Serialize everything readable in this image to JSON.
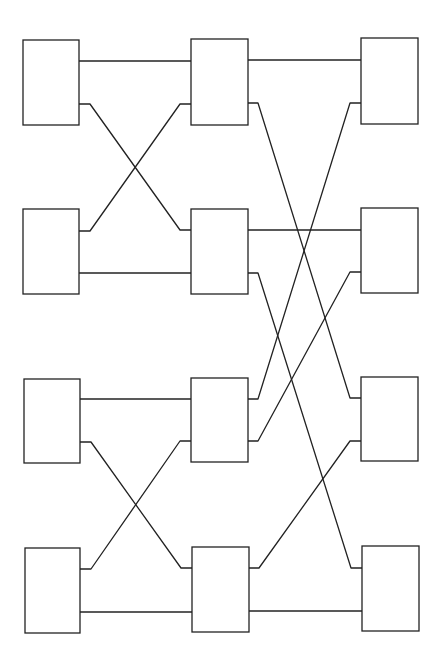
{
  "diagram": {
    "type": "butterfly-network",
    "stroke_color": "#222222",
    "background": "#ffffff",
    "columns": 3,
    "rows": 4,
    "nodes": [
      {
        "id": "L1",
        "col": 0,
        "row": 0,
        "x": 23,
        "y": 40,
        "w": 56,
        "h": 85,
        "ports": [
          61,
          104
        ]
      },
      {
        "id": "L2",
        "col": 0,
        "row": 1,
        "x": 23,
        "y": 209,
        "w": 56,
        "h": 85,
        "ports": [
          231,
          273
        ]
      },
      {
        "id": "L3",
        "col": 0,
        "row": 2,
        "x": 24,
        "y": 379,
        "w": 56,
        "h": 84,
        "ports": [
          399,
          442
        ]
      },
      {
        "id": "L4",
        "col": 0,
        "row": 3,
        "x": 25,
        "y": 548,
        "w": 55,
        "h": 85,
        "ports": [
          569,
          612
        ]
      },
      {
        "id": "M1",
        "col": 1,
        "row": 0,
        "x": 191,
        "y": 39,
        "w": 57,
        "h": 86,
        "ports": [
          61,
          104
        ]
      },
      {
        "id": "M2",
        "col": 1,
        "row": 1,
        "x": 191,
        "y": 209,
        "w": 57,
        "h": 85,
        "ports": [
          230,
          273
        ]
      },
      {
        "id": "M3",
        "col": 1,
        "row": 2,
        "x": 191,
        "y": 378,
        "w": 57,
        "h": 84,
        "ports": [
          399,
          441
        ]
      },
      {
        "id": "M4",
        "col": 1,
        "row": 3,
        "x": 192,
        "y": 547,
        "w": 57,
        "h": 85,
        "ports": [
          568,
          611
        ]
      },
      {
        "id": "R1",
        "col": 2,
        "row": 0,
        "x": 361,
        "y": 38,
        "w": 57,
        "h": 86,
        "ports": [
          60,
          103
        ]
      },
      {
        "id": "R2",
        "col": 2,
        "row": 1,
        "x": 361,
        "y": 208,
        "w": 57,
        "h": 85,
        "ports": [
          229,
          272
        ]
      },
      {
        "id": "R3",
        "col": 2,
        "row": 2,
        "x": 361,
        "y": 377,
        "w": 57,
        "h": 84,
        "ports": [
          398,
          441
        ]
      },
      {
        "id": "R4",
        "col": 2,
        "row": 3,
        "x": 362,
        "y": 546,
        "w": 57,
        "h": 85,
        "ports": [
          568,
          610
        ]
      }
    ],
    "edges": [
      {
        "from": "L1",
        "to": "M1",
        "points": "79,61 191,61"
      },
      {
        "from": "L1",
        "to": "M2",
        "points": "79,104 90,104 180,230 191,230"
      },
      {
        "from": "L2",
        "to": "M1",
        "points": "79,231 90,231 180,104 191,104"
      },
      {
        "from": "L2",
        "to": "M2",
        "points": "79,273 191,273"
      },
      {
        "from": "L3",
        "to": "M3",
        "points": "80,399 191,399"
      },
      {
        "from": "L3",
        "to": "M4",
        "points": "80,442 91,442 181,568 192,568"
      },
      {
        "from": "L4",
        "to": "M3",
        "points": "80,569 91,569 180,441 191,441"
      },
      {
        "from": "L4",
        "to": "M4",
        "points": "80,612 192,612"
      },
      {
        "from": "M1",
        "to": "R1",
        "points": "248,60 361,60"
      },
      {
        "from": "M1",
        "to": "R3",
        "points": "248,103 258,103 350,398 361,398"
      },
      {
        "from": "M2",
        "to": "R2",
        "points": "248,230 361,230"
      },
      {
        "from": "M2",
        "to": "R4",
        "points": "248,273 258,273 351,568 362,568"
      },
      {
        "from": "M3",
        "to": "R1",
        "points": "248,399 258,399 350,103 361,103"
      },
      {
        "from": "M3",
        "to": "R2",
        "points": "248,441 258,441 350,272 361,272"
      },
      {
        "from": "M4",
        "to": "R3",
        "points": "249,568 259,568 350,441 361,441"
      },
      {
        "from": "M4",
        "to": "R4",
        "points": "249,611 362,611"
      }
    ]
  }
}
